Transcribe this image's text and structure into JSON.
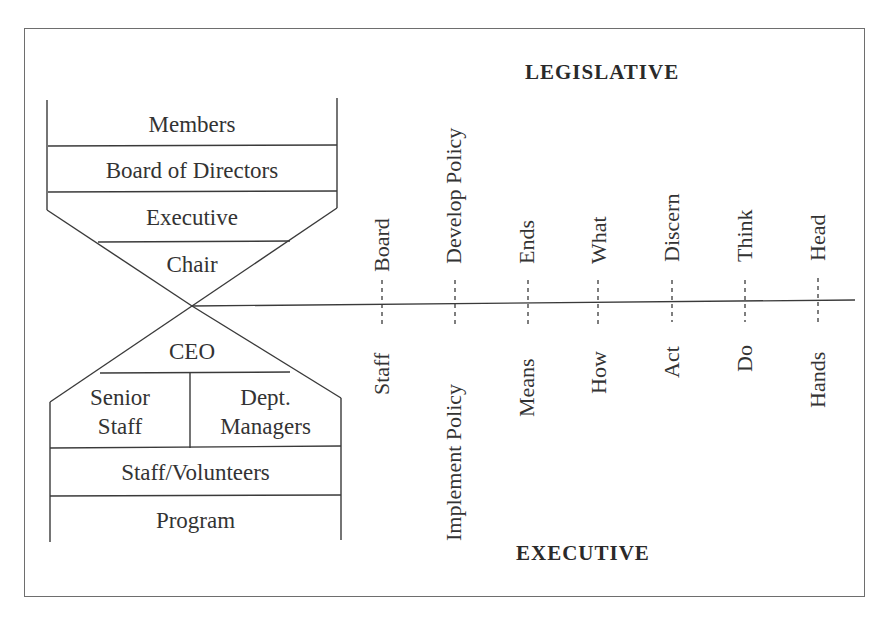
{
  "titles": {
    "top": "LEGISLATIVE",
    "bottom": "EXECUTIVE"
  },
  "hierarchy": {
    "upper": [
      {
        "label": "Members"
      },
      {
        "label": "Board of Directors"
      },
      {
        "label": "Executive"
      },
      {
        "label": "Chair"
      }
    ],
    "lower": {
      "ceo": "CEO",
      "senior_staff": [
        "Senior",
        "Staff"
      ],
      "dept_managers": [
        "Dept.",
        "Managers"
      ],
      "staff_volunteers": "Staff/Volunteers",
      "program": "Program"
    }
  },
  "pairs": [
    {
      "legislative": "Board",
      "executive": "Staff"
    },
    {
      "legislative": "Develop Policy",
      "executive": "Implement Policy"
    },
    {
      "legislative": "Ends",
      "executive": "Means"
    },
    {
      "legislative": "What",
      "executive": "How"
    },
    {
      "legislative": "Discern",
      "executive": "Act"
    },
    {
      "legislative": "Think",
      "executive": "Do"
    },
    {
      "legislative": "Head",
      "executive": "Hands"
    }
  ],
  "colors": {
    "line": "#3a3a3a",
    "frame": "#6e6e6e",
    "text": "#333333",
    "background": "#ffffff"
  }
}
